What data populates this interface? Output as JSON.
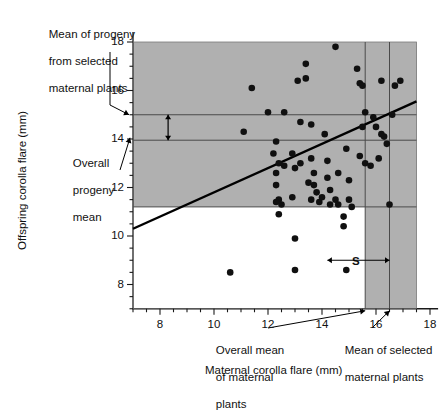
{
  "figure": {
    "xlabel": "Maternal corolla flare (mm)",
    "ylabel": "Offspring corolla flare (mm)"
  },
  "annotations": {
    "progeny_selected": "Mean of progeny\nfrom selected\nmaternal plants",
    "progeny_selected_l1": "Mean of progeny",
    "progeny_selected_l2": "from selected",
    "progeny_selected_l3": "maternal plants",
    "overall_progeny_l1": "Overall",
    "overall_progeny_l2": "progeny",
    "overall_progeny_l3": "mean",
    "overall_maternal_l1": "Overall mean",
    "overall_maternal_l2": "of maternal",
    "overall_maternal_l3": "plants",
    "selected_maternal_l1": "Mean of selected",
    "selected_maternal_l2": "maternal plants",
    "R_label": "R",
    "S_label": "S"
  },
  "colors": {
    "shade": "#b0b0b0",
    "point": "#101010",
    "line": "#000000",
    "rule": "#4a4a4a",
    "axis": "#1a1a1a"
  },
  "chart_data": {
    "type": "scatter",
    "title": "",
    "xlabel": "Maternal corolla flare (mm)",
    "ylabel": "Offspring corolla flare (mm)",
    "xlim": [
      7.0,
      18.5
    ],
    "ylim": [
      7.0,
      18.8
    ],
    "xticks": [
      8,
      10,
      12,
      14,
      16,
      18
    ],
    "yticks": [
      8,
      10,
      12,
      14,
      16,
      18
    ],
    "xminor_step": 0.5,
    "yminor_step": 0.5,
    "grid": false,
    "legend": null,
    "regression_line": {
      "label": "parent-offspring regression",
      "x_start": 7.0,
      "y_start": 10.3,
      "x_end": 17.5,
      "y_end": 15.55,
      "slope": 0.5,
      "intercept": 6.8
    },
    "reference_lines": [
      {
        "name": "mean-progeny-of-selected",
        "orientation": "horizontal",
        "value": 15.0
      },
      {
        "name": "overall-progeny-mean",
        "orientation": "horizontal",
        "value": 13.95
      },
      {
        "name": "shade-lower-bound",
        "orientation": "horizontal",
        "value": 11.2
      },
      {
        "name": "overall-maternal-mean",
        "orientation": "vertical",
        "value": 15.6
      },
      {
        "name": "selected-maternal-mean",
        "orientation": "vertical",
        "value": 16.5
      }
    ],
    "shaded_regions": [
      {
        "name": "progeny-shade",
        "x_range": [
          7.0,
          17.5
        ],
        "y_range": [
          11.2,
          18.5
        ]
      },
      {
        "name": "selected-maternal-shade",
        "x_range": [
          15.6,
          17.5
        ],
        "y_range": [
          7.0,
          18.5
        ]
      }
    ],
    "intervals": [
      {
        "name": "R",
        "axis": "y",
        "from": 13.95,
        "to": 15.0,
        "label": "R"
      },
      {
        "name": "S",
        "axis": "x",
        "from": 14.2,
        "to": 16.5,
        "label": "S"
      }
    ],
    "points": [
      [
        11.1,
        14.3
      ],
      [
        11.4,
        16.1
      ],
      [
        10.6,
        8.5
      ],
      [
        12.3,
        12.1
      ],
      [
        12.0,
        15.1
      ],
      [
        12.6,
        15.1
      ],
      [
        12.3,
        13.9
      ],
      [
        12.2,
        13.4
      ],
      [
        12.4,
        13.0
      ],
      [
        12.6,
        12.9
      ],
      [
        12.3,
        12.6
      ],
      [
        12.4,
        11.5
      ],
      [
        12.3,
        11.4
      ],
      [
        12.5,
        11.3
      ],
      [
        12.4,
        10.9
      ],
      [
        12.9,
        13.4
      ],
      [
        13.0,
        12.8
      ],
      [
        12.9,
        11.6
      ],
      [
        13.0,
        8.6
      ],
      [
        13.0,
        9.9
      ],
      [
        13.2,
        14.7
      ],
      [
        13.1,
        16.4
      ],
      [
        13.4,
        16.5
      ],
      [
        13.4,
        17.1
      ],
      [
        13.6,
        14.6
      ],
      [
        13.6,
        13.2
      ],
      [
        13.7,
        12.6
      ],
      [
        13.5,
        12.2
      ],
      [
        13.7,
        12.1
      ],
      [
        13.8,
        11.8
      ],
      [
        13.6,
        11.5
      ],
      [
        13.9,
        11.4
      ],
      [
        14.0,
        11.6
      ],
      [
        14.1,
        14.2
      ],
      [
        14.2,
        13.1
      ],
      [
        14.3,
        11.9
      ],
      [
        14.3,
        11.3
      ],
      [
        14.5,
        11.5
      ],
      [
        14.6,
        11.3
      ],
      [
        14.8,
        10.8
      ],
      [
        14.8,
        10.4
      ],
      [
        14.9,
        8.6
      ],
      [
        14.6,
        12.6
      ],
      [
        14.5,
        17.8
      ],
      [
        14.9,
        13.6
      ],
      [
        15.0,
        11.5
      ],
      [
        15.1,
        11.2
      ],
      [
        15.3,
        16.9
      ],
      [
        15.4,
        16.3
      ],
      [
        15.5,
        16.2
      ],
      [
        15.6,
        15.1
      ],
      [
        15.5,
        14.5
      ],
      [
        15.4,
        13.3
      ],
      [
        15.6,
        13.0
      ],
      [
        15.8,
        12.9
      ],
      [
        15.9,
        14.9
      ],
      [
        16.0,
        14.5
      ],
      [
        16.1,
        13.2
      ],
      [
        16.2,
        14.2
      ],
      [
        16.3,
        14.1
      ],
      [
        16.5,
        11.3
      ],
      [
        16.6,
        15.0
      ],
      [
        16.7,
        16.2
      ],
      [
        16.9,
        16.4
      ],
      [
        16.2,
        16.4
      ],
      [
        14.2,
        12.4
      ],
      [
        15.0,
        12.3
      ],
      [
        13.2,
        13.0
      ],
      [
        16.4,
        13.8
      ]
    ]
  }
}
